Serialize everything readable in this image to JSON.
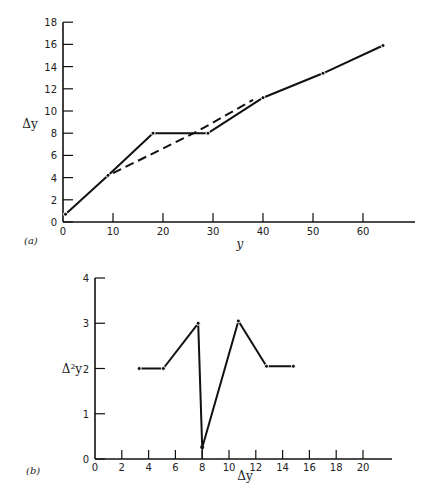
{
  "chart_data": [
    {
      "type": "line",
      "panel_label": "(a)",
      "xlabel": "y",
      "ylabel": "Δy",
      "xlim": [
        0,
        70
      ],
      "ylim": [
        0,
        18
      ],
      "x_ticks": [
        0,
        10,
        20,
        30,
        40,
        50,
        60
      ],
      "y_ticks": [
        0,
        2,
        4,
        6,
        8,
        10,
        12,
        14,
        16,
        18
      ],
      "grid": false,
      "series": [
        {
          "name": "observed",
          "style": "solid",
          "x": [
            0.5,
            9,
            18,
            29,
            40,
            52,
            64
          ],
          "y": [
            0.7,
            4.2,
            8.0,
            8.0,
            11.2,
            13.4,
            15.9
          ]
        },
        {
          "name": "smoothed",
          "style": "dashed",
          "x": [
            10,
            27,
            38
          ],
          "y": [
            4.4,
            8.2,
            11.0
          ]
        }
      ]
    },
    {
      "type": "line",
      "panel_label": "(b)",
      "xlabel": "Δy",
      "ylabel": "Δ²y",
      "xlim": [
        0,
        22
      ],
      "ylim": [
        0,
        4
      ],
      "x_ticks": [
        0,
        2,
        4,
        6,
        8,
        10,
        12,
        14,
        16,
        18,
        20
      ],
      "y_ticks": [
        0,
        1,
        2,
        3,
        4
      ],
      "grid": false,
      "series": [
        {
          "name": "second difference",
          "style": "solid",
          "x": [
            3.3,
            5.1,
            7.7,
            8.0,
            10.7,
            12.8,
            14.8
          ],
          "y": [
            2.0,
            2.0,
            3.0,
            0.25,
            3.05,
            2.05,
            2.05
          ]
        }
      ]
    }
  ]
}
